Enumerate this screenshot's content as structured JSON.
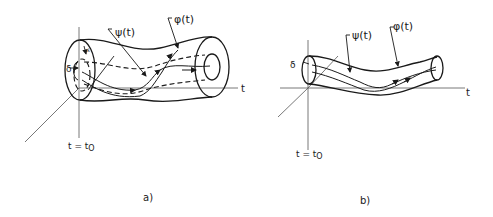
{
  "figure": {
    "panel_a": {
      "caption": "a)",
      "psi_label": "ψ(t)",
      "phi_label": "φ(t)",
      "axis_label": "t",
      "origin_label": "t = t",
      "origin_subscript": "O",
      "radius_outer_label": "δ",
      "radius_inner_label": "ε"
    },
    "panel_b": {
      "caption": "b)",
      "psi_label": "ψ(t)",
      "phi_label": "φ(t)",
      "axis_label": "t",
      "origin_label": "t = t",
      "origin_subscript": "O",
      "radius_label": "δ"
    },
    "colors": {
      "ink": "#1a1a1a",
      "axis": "#555555",
      "background": "#ffffff"
    }
  }
}
